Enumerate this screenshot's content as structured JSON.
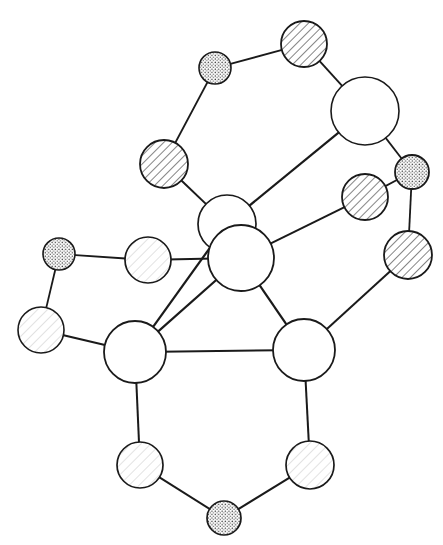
{
  "canvas": {
    "width": 443,
    "height": 545,
    "background_color": "#ffffff",
    "stroke_color": "#1a1a1a",
    "title": "Node link graph diagram"
  },
  "legend": {
    "fill_styles": [
      {
        "key": "plain",
        "label": "plain white fill"
      },
      {
        "key": "hatch",
        "label": "diagonal hatch fill"
      },
      {
        "key": "hatch_faint",
        "label": "faint diagonal hatch fill"
      },
      {
        "key": "dots",
        "label": "dotted stipple fill"
      }
    ]
  },
  "chart_data": {
    "type": "diagram",
    "node_count": 18,
    "edge_count": 21,
    "nodes": [
      {
        "id": "n1",
        "label": "",
        "cx": 215,
        "cy": 68,
        "r": 16,
        "fill": "dots",
        "stroke_width": 1.6
      },
      {
        "id": "n2",
        "label": "",
        "cx": 304,
        "cy": 44,
        "r": 23,
        "fill": "hatch",
        "stroke_width": 1.8
      },
      {
        "id": "n3",
        "label": "",
        "cx": 365,
        "cy": 111,
        "r": 34,
        "fill": "plain",
        "stroke_width": 1.6
      },
      {
        "id": "n4",
        "label": "",
        "cx": 164,
        "cy": 164,
        "r": 24,
        "fill": "hatch",
        "stroke_width": 1.8
      },
      {
        "id": "n5",
        "label": "",
        "cx": 412,
        "cy": 172,
        "r": 17,
        "fill": "dots",
        "stroke_width": 1.8
      },
      {
        "id": "n6",
        "label": "",
        "cx": 365,
        "cy": 197,
        "r": 23,
        "fill": "hatch",
        "stroke_width": 1.8
      },
      {
        "id": "n7",
        "label": "",
        "cx": 227,
        "cy": 224,
        "r": 29,
        "fill": "plain",
        "stroke_width": 1.7
      },
      {
        "id": "n8",
        "label": "",
        "cx": 241,
        "cy": 258,
        "r": 33,
        "fill": "plain",
        "stroke_width": 1.8
      },
      {
        "id": "n9",
        "label": "",
        "cx": 408,
        "cy": 255,
        "r": 24,
        "fill": "hatch",
        "stroke_width": 1.8
      },
      {
        "id": "n10",
        "label": "",
        "cx": 59,
        "cy": 254,
        "r": 16,
        "fill": "dots",
        "stroke_width": 1.6
      },
      {
        "id": "n11",
        "label": "",
        "cx": 148,
        "cy": 260,
        "r": 23,
        "fill": "hatch_faint",
        "stroke_width": 1.7
      },
      {
        "id": "n12",
        "label": "",
        "cx": 41,
        "cy": 330,
        "r": 23,
        "fill": "hatch_faint",
        "stroke_width": 1.6
      },
      {
        "id": "n13",
        "label": "",
        "cx": 135,
        "cy": 352,
        "r": 31,
        "fill": "plain",
        "stroke_width": 1.8
      },
      {
        "id": "n14",
        "label": "",
        "cx": 304,
        "cy": 350,
        "r": 31,
        "fill": "plain",
        "stroke_width": 1.8
      },
      {
        "id": "n15",
        "label": "",
        "cx": 140,
        "cy": 465,
        "r": 23,
        "fill": "hatch_faint",
        "stroke_width": 1.7
      },
      {
        "id": "n16",
        "label": "",
        "cx": 310,
        "cy": 465,
        "r": 24,
        "fill": "hatch_faint",
        "stroke_width": 1.7
      },
      {
        "id": "n17",
        "label": "",
        "cx": 224,
        "cy": 518,
        "r": 17,
        "fill": "dots",
        "stroke_width": 1.7
      },
      {
        "id": "n18",
        "label": "",
        "cx": 228,
        "cy": 247,
        "r": 0,
        "fill": "plain",
        "stroke_width": 0
      }
    ],
    "edges": [
      {
        "from": "n1",
        "to": "n2",
        "width": 1.9
      },
      {
        "from": "n1",
        "to": "n4",
        "width": 1.9
      },
      {
        "from": "n2",
        "to": "n3",
        "width": 1.9
      },
      {
        "from": "n3",
        "to": "n5",
        "width": 1.8
      },
      {
        "from": "n3",
        "to": "n7",
        "width": 2.2
      },
      {
        "from": "n4",
        "to": "n7",
        "width": 2.0
      },
      {
        "from": "n5",
        "to": "n6",
        "width": 1.8
      },
      {
        "from": "n5",
        "to": "n9",
        "width": 1.8
      },
      {
        "from": "n6",
        "to": "n8",
        "width": 2.0
      },
      {
        "from": "n8",
        "to": "n11",
        "width": 2.0
      },
      {
        "from": "n8",
        "to": "n13",
        "width": 2.2
      },
      {
        "from": "n7",
        "to": "n13",
        "width": 2.2
      },
      {
        "from": "n8",
        "to": "n14",
        "width": 2.2
      },
      {
        "from": "n9",
        "to": "n14",
        "width": 2.0
      },
      {
        "from": "n10",
        "to": "n11",
        "width": 1.8
      },
      {
        "from": "n10",
        "to": "n12",
        "width": 1.8
      },
      {
        "from": "n12",
        "to": "n13",
        "width": 2.0
      },
      {
        "from": "n13",
        "to": "n14",
        "width": 2.0
      },
      {
        "from": "n13",
        "to": "n15",
        "width": 2.0
      },
      {
        "from": "n14",
        "to": "n16",
        "width": 2.0
      },
      {
        "from": "n15",
        "to": "n17",
        "width": 2.0
      },
      {
        "from": "n16",
        "to": "n17",
        "width": 2.0
      }
    ]
  }
}
